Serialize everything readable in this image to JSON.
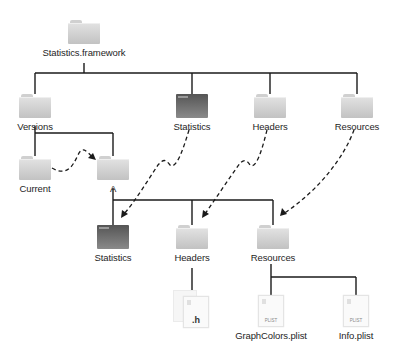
{
  "diagram": {
    "type": "tree",
    "root": {
      "label": "Statistics.framework",
      "icon": "folder-icon"
    },
    "top_level": [
      {
        "id": "versions",
        "label": "Versions",
        "icon": "folder-icon"
      },
      {
        "id": "statistics_link",
        "label": "Statistics",
        "icon": "executable-icon",
        "link_to": "a_statistics"
      },
      {
        "id": "headers_link",
        "label": "Headers",
        "icon": "folder-icon",
        "link_to": "a_headers"
      },
      {
        "id": "resources_link",
        "label": "Resources",
        "icon": "folder-icon",
        "link_to": "a_resources"
      }
    ],
    "versions_children": [
      {
        "id": "current",
        "label": "Current",
        "icon": "folder-icon",
        "link_to": "a"
      },
      {
        "id": "a",
        "label": "A",
        "icon": "folder-icon"
      }
    ],
    "a_children": [
      {
        "id": "a_statistics",
        "label": "Statistics",
        "icon": "executable-icon"
      },
      {
        "id": "a_headers",
        "label": "Headers",
        "icon": "folder-icon"
      },
      {
        "id": "a_resources",
        "label": "Resources",
        "icon": "folder-icon"
      }
    ],
    "headers_children": [
      {
        "id": "header_files",
        "label": ".h",
        "icon": "header-file-icon"
      }
    ],
    "resources_children": [
      {
        "id": "graphcolors",
        "label": "GraphColors.plist",
        "badge": "PLIST",
        "icon": "plist-file-icon"
      },
      {
        "id": "info",
        "label": "Info.plist",
        "badge": "PLIST",
        "icon": "plist-file-icon"
      }
    ],
    "legend": {
      "solid_line": "contains",
      "dashed_arrow": "symbolic link"
    },
    "colors": {
      "line": "#1a1a1a",
      "folder_light": "#d0d0d0",
      "folder_dark": "#5a5a5a"
    }
  }
}
